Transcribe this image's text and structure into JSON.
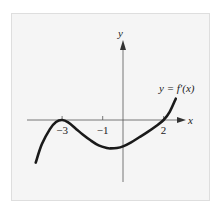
{
  "chart_data": {
    "type": "line",
    "title": "",
    "xlabel": "x",
    "ylabel": "y",
    "curve_label": "y = f′(x)",
    "xlim": [
      -4.4,
      3.1
    ],
    "ylim": [
      -3.1,
      3.9
    ],
    "x_ticks": [
      {
        "value": -3,
        "label": "−3"
      },
      {
        "value": -1,
        "label": "−1"
      },
      {
        "value": 2,
        "label": "2"
      }
    ],
    "series": [
      {
        "name": "f'(x)",
        "x": [
          -4.3,
          -4.0,
          -3.6,
          -3.3,
          -3.0,
          -2.7,
          -2.3,
          -2.0,
          -1.6,
          -1.2,
          -0.8,
          -0.6,
          -0.3,
          0.0,
          0.4,
          0.8,
          1.2,
          1.6,
          2.0,
          2.3,
          2.6
        ],
        "y": [
          -2.1,
          -1.2,
          -0.45,
          -0.1,
          0.0,
          -0.12,
          -0.45,
          -0.7,
          -1.0,
          -1.25,
          -1.38,
          -1.4,
          -1.38,
          -1.3,
          -1.1,
          -0.85,
          -0.6,
          -0.32,
          0.0,
          0.4,
          1.05
        ]
      }
    ],
    "grid": false,
    "legend": "none"
  }
}
